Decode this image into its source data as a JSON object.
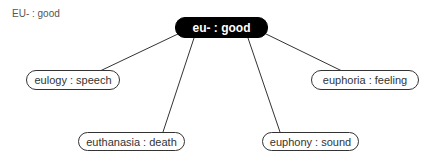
{
  "caption": "EU- : good",
  "root": {
    "label": "eu- : good"
  },
  "children": [
    {
      "label": "eulogy : speech"
    },
    {
      "label": "euphoria : feeling"
    },
    {
      "label": "euthanasia : death"
    },
    {
      "label": "euphony : sound"
    }
  ],
  "colors": {
    "root_bg": "#000000",
    "line": "#333333"
  }
}
